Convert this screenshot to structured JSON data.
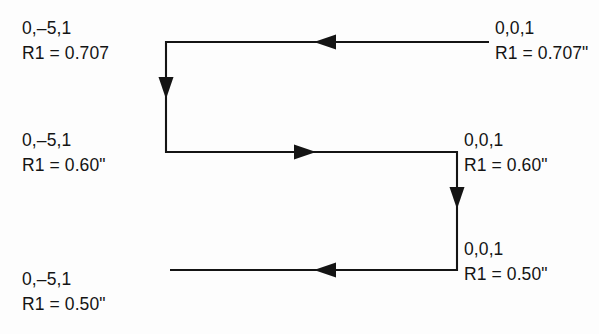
{
  "figure": {
    "background_color": "#fdfdfd",
    "line_color": "#141414",
    "text_color": "#141414"
  },
  "labels": {
    "top_left": {
      "line1": "0,–5,1",
      "line2": "R1 = 0.707"
    },
    "top_right": {
      "line1": "0,0,1",
      "line2": "R1 = 0.707\""
    },
    "mid_left": {
      "line1": "0,–5,1",
      "line2": "R1 = 0.60\""
    },
    "mid_right": {
      "line1": "0,0,1",
      "line2": "R1 = 0.60\""
    },
    "bottom_left": {
      "line1": "0,–5,1",
      "line2": "R1 = 0.50\""
    },
    "bottom_right": {
      "line1": "0,0,1",
      "line2": "R1 = 0.50\""
    }
  },
  "paths": {
    "top_segment": {
      "name": "top-horizontal-path",
      "direction": "leftward",
      "from_x": 489,
      "to_x": 166,
      "y": 42,
      "arrow_x": 325
    },
    "left_segment": {
      "name": "left-vertical-path",
      "direction": "downward",
      "x": 166,
      "from_y": 42,
      "to_y": 152,
      "arrow_y": 90
    },
    "middle_segment": {
      "name": "middle-horizontal-path",
      "direction": "rightward",
      "from_x": 166,
      "to_x": 457,
      "y": 152,
      "arrow_x": 305
    },
    "right_segment": {
      "name": "right-vertical-path",
      "direction": "downward",
      "x": 457,
      "from_y": 152,
      "to_y": 270,
      "arrow_y": 200
    },
    "bottom_segment": {
      "name": "bottom-horizontal-path",
      "direction": "leftward",
      "from_x": 457,
      "to_x": 170,
      "y": 270,
      "arrow_x": 325
    }
  }
}
